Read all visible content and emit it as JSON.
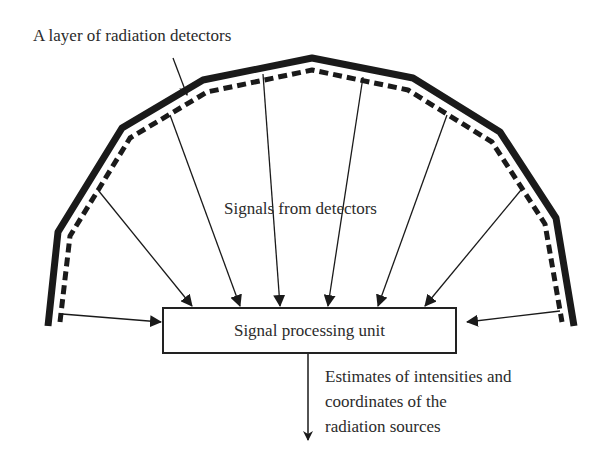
{
  "diagram": {
    "type": "block-diagram",
    "detector_layer": {
      "label": "A layer of radiation detectors",
      "shape": "polygonal arc (solid outer line with dashed inner line)",
      "colors": {
        "line": "#1a1a1a"
      }
    },
    "signals": {
      "label": "Signals from detectors",
      "arrow_count": 8
    },
    "processing_unit": {
      "label": "Signal processing unit"
    },
    "output": {
      "lines": [
        "Estimates of intensities and",
        "coordinates of the",
        "radiation sources"
      ]
    }
  }
}
